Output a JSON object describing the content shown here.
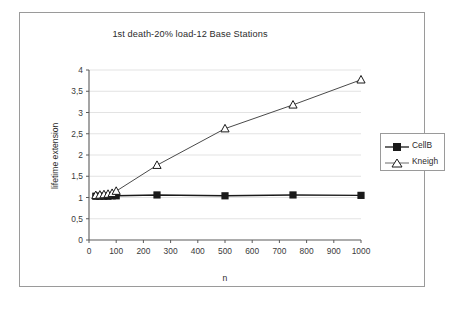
{
  "chart_data": {
    "type": "line",
    "title": "1st death-20% load-12 Base Stations",
    "xlabel": "n",
    "ylabel": "lifetime extension",
    "xlim": [
      0,
      1000
    ],
    "ylim": [
      0,
      4
    ],
    "grid": "horizontal",
    "legend_position": "right",
    "xticks": [
      "0",
      "100",
      "200",
      "300",
      "400",
      "500",
      "600",
      "700",
      "800",
      "900",
      "1000"
    ],
    "xtick_values": [
      0,
      100,
      200,
      300,
      400,
      500,
      600,
      700,
      800,
      900,
      1000
    ],
    "yticks": [
      "0",
      "0,5",
      "1",
      "1,5",
      "2",
      "2,5",
      "3",
      "3,5",
      "4"
    ],
    "ytick_values": [
      0,
      0.5,
      1,
      1.5,
      2,
      2.5,
      3,
      3.5,
      4
    ],
    "series": [
      {
        "name": "CellB",
        "marker": "filled-square",
        "color": "#1a1a1a",
        "x": [
          25,
          40,
          55,
          70,
          85,
          100,
          250,
          500,
          750,
          1000
        ],
        "values": [
          1.03,
          1.03,
          1.03,
          1.03,
          1.04,
          1.04,
          1.06,
          1.04,
          1.06,
          1.05
        ]
      },
      {
        "name": "Kneigh",
        "marker": "hollow-triangle",
        "color": "#4a4a4a",
        "x": [
          25,
          40,
          55,
          70,
          85,
          100,
          250,
          500,
          750,
          1000
        ],
        "values": [
          1.05,
          1.06,
          1.07,
          1.08,
          1.1,
          1.15,
          1.76,
          2.62,
          3.18,
          3.77
        ]
      }
    ]
  },
  "legend": {
    "items": [
      {
        "label": "CellB"
      },
      {
        "label": "Kneigh"
      }
    ]
  }
}
